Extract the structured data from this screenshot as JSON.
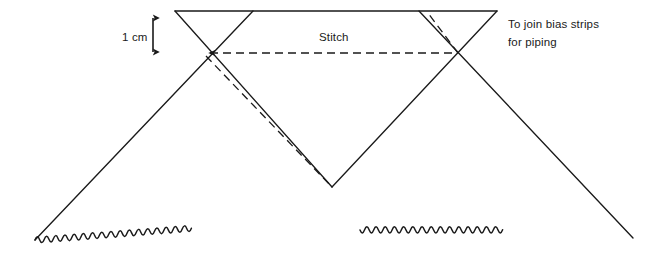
{
  "diagram": {
    "title": "To join bias strips for piping",
    "background_color": "#ffffff",
    "line_color": "#1a1a1a",
    "text_color": "#1a1a1a",
    "labels": {
      "measurement": "1 cm",
      "stitch": "Stitch",
      "note_line_1": "To join bias strips",
      "note_line_2": "for piping"
    },
    "geometry": {
      "top_edge": {
        "x1": 175,
        "y1": 11,
        "x2": 497,
        "y2": 11
      },
      "crossing_left": {
        "x": 203,
        "y": 53
      },
      "crossing_right": {
        "x": 458,
        "y": 53
      },
      "crossing_bottom": {
        "x": 332,
        "y": 187
      },
      "bottom_left_vertex": {
        "x": 35,
        "y": 240
      },
      "bottom_right_vertex": {
        "x": 633,
        "y": 238
      },
      "solid_lines": [
        {
          "name": "top-edge",
          "x1": 175,
          "y1": 11,
          "x2": 497,
          "y2": 11
        },
        {
          "name": "left-strip-down-right",
          "x1": 175,
          "y1": 11,
          "x2": 332,
          "y2": 187
        },
        {
          "name": "left-strip-long-diagonal",
          "x1": 253,
          "y1": 11,
          "x2": 35,
          "y2": 240
        },
        {
          "name": "right-strip-down-left",
          "x1": 497,
          "y1": 11,
          "x2": 332,
          "y2": 187
        },
        {
          "name": "right-strip-long-diagonal",
          "x1": 419,
          "y1": 11,
          "x2": 633,
          "y2": 238
        }
      ],
      "wavy_edges": [
        {
          "name": "bottom-left-pinked-edge",
          "x1": 35,
          "y1": 240,
          "x2": 332,
          "y2": 230
        },
        {
          "name": "bottom-right-pinked-edge",
          "x1": 360,
          "y1": 230,
          "x2": 633,
          "y2": 238
        }
      ],
      "dashed_lines": [
        {
          "name": "stitch-line",
          "x1": 203,
          "y1": 53,
          "x2": 458,
          "y2": 53
        },
        {
          "name": "fold-diagonal-lower",
          "x1": 203,
          "y1": 53,
          "x2": 332,
          "y2": 187
        },
        {
          "name": "fold-diagonal-upper",
          "x1": 458,
          "y1": 53,
          "x2": 428,
          "y2": 13
        }
      ],
      "measure_arrow": {
        "x": 153,
        "y_top": 13,
        "y_bottom": 57
      }
    }
  }
}
